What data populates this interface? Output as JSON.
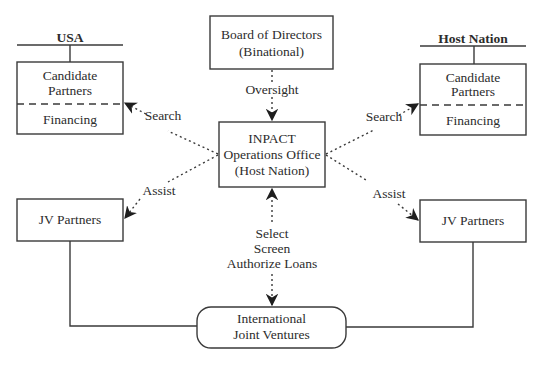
{
  "diagram": {
    "type": "organizational-flow",
    "groups": {
      "usa": {
        "label": "USA"
      },
      "host": {
        "label": "Host Nation"
      }
    },
    "nodes": {
      "board": {
        "line1": "Board of Directors",
        "line2": "(Binational)"
      },
      "ops": {
        "line1": "INPACT",
        "line2": "Operations Office",
        "line3": "(Host Nation)"
      },
      "usa_candidates": {
        "line1": "Candidate",
        "line2": "Partners",
        "lower": "Financing"
      },
      "host_candidates": {
        "line1": "Candidate",
        "line2": "Partners",
        "lower": "Financing"
      },
      "jv_left": {
        "label": "JV Partners"
      },
      "jv_right": {
        "label": "JV Partners"
      },
      "ijv": {
        "line1": "International",
        "line2": "Joint Ventures"
      }
    },
    "edges": {
      "oversight": "Oversight",
      "search_left": "Search",
      "search_right": "Search",
      "assist_left": "Assist",
      "assist_right": "Assist",
      "select": "Select",
      "screen": "Screen",
      "authorize": "Authorize Loans"
    },
    "colors": {
      "line": "#3a3a3a",
      "text": "#2c2c2c",
      "background": "#ffffff"
    }
  }
}
